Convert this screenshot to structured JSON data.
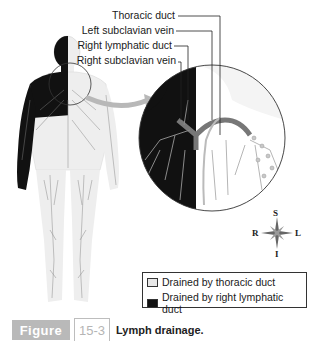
{
  "labels": {
    "thoracic_duct": "Thoracic duct",
    "left_subclavian_vein": "Left subclavian vein",
    "right_lymphatic_duct": "Right lymphatic duct",
    "right_subclavian_vein": "Right subclavian vein"
  },
  "compass": {
    "superior": "S",
    "inferior": "I",
    "right": "R",
    "left": "L"
  },
  "legend": {
    "items": [
      {
        "label": "Drained by thoracic duct",
        "color": "#e8e8e8"
      },
      {
        "label": "Drained by right lymphatic duct",
        "color": "#111111"
      }
    ]
  },
  "figure": {
    "tag": "Figure",
    "number": "15-3",
    "caption": "Lymph drainage."
  },
  "colors": {
    "dark_region": "#111111",
    "light_region": "#eeeeee",
    "vessel_gray": "#8a8a8a",
    "figure_tag_bg": "#b9b9b9"
  }
}
